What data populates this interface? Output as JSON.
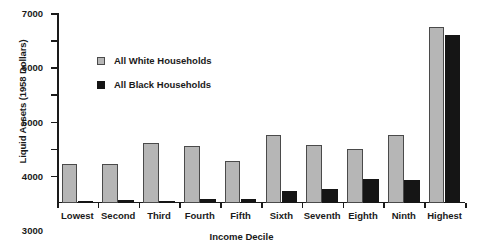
{
  "chart_data": {
    "type": "bar",
    "title": "",
    "xlabel": "Income Decile",
    "ylabel": "Liquid Assets (1958 Dollars)",
    "categories": [
      "Lowest",
      "Second",
      "Third",
      "Fourth",
      "Fifth",
      "Sixth",
      "Seventh",
      "Eighth",
      "Ninth",
      "Highest"
    ],
    "series": [
      {
        "name": "All White Households",
        "color": "#b6b6b6",
        "values": [
          1430,
          1430,
          2200,
          2100,
          1550,
          2500,
          2150,
          2000,
          2500,
          6500
        ]
      },
      {
        "name": "All Black Households",
        "color": "#151515",
        "values": [
          60,
          110,
          90,
          130,
          160,
          450,
          500,
          900,
          850,
          6200
        ]
      }
    ],
    "ylim": [
      0,
      7000
    ],
    "yticks": [
      1000,
      2000,
      3000,
      4000,
      5000,
      6000,
      7000
    ],
    "ytick_labels": [
      "1000",
      "2000",
      "3000",
      "4000",
      "5000",
      "6000",
      "7000"
    ],
    "grid": false,
    "legend_position": "upper-left-inside"
  }
}
